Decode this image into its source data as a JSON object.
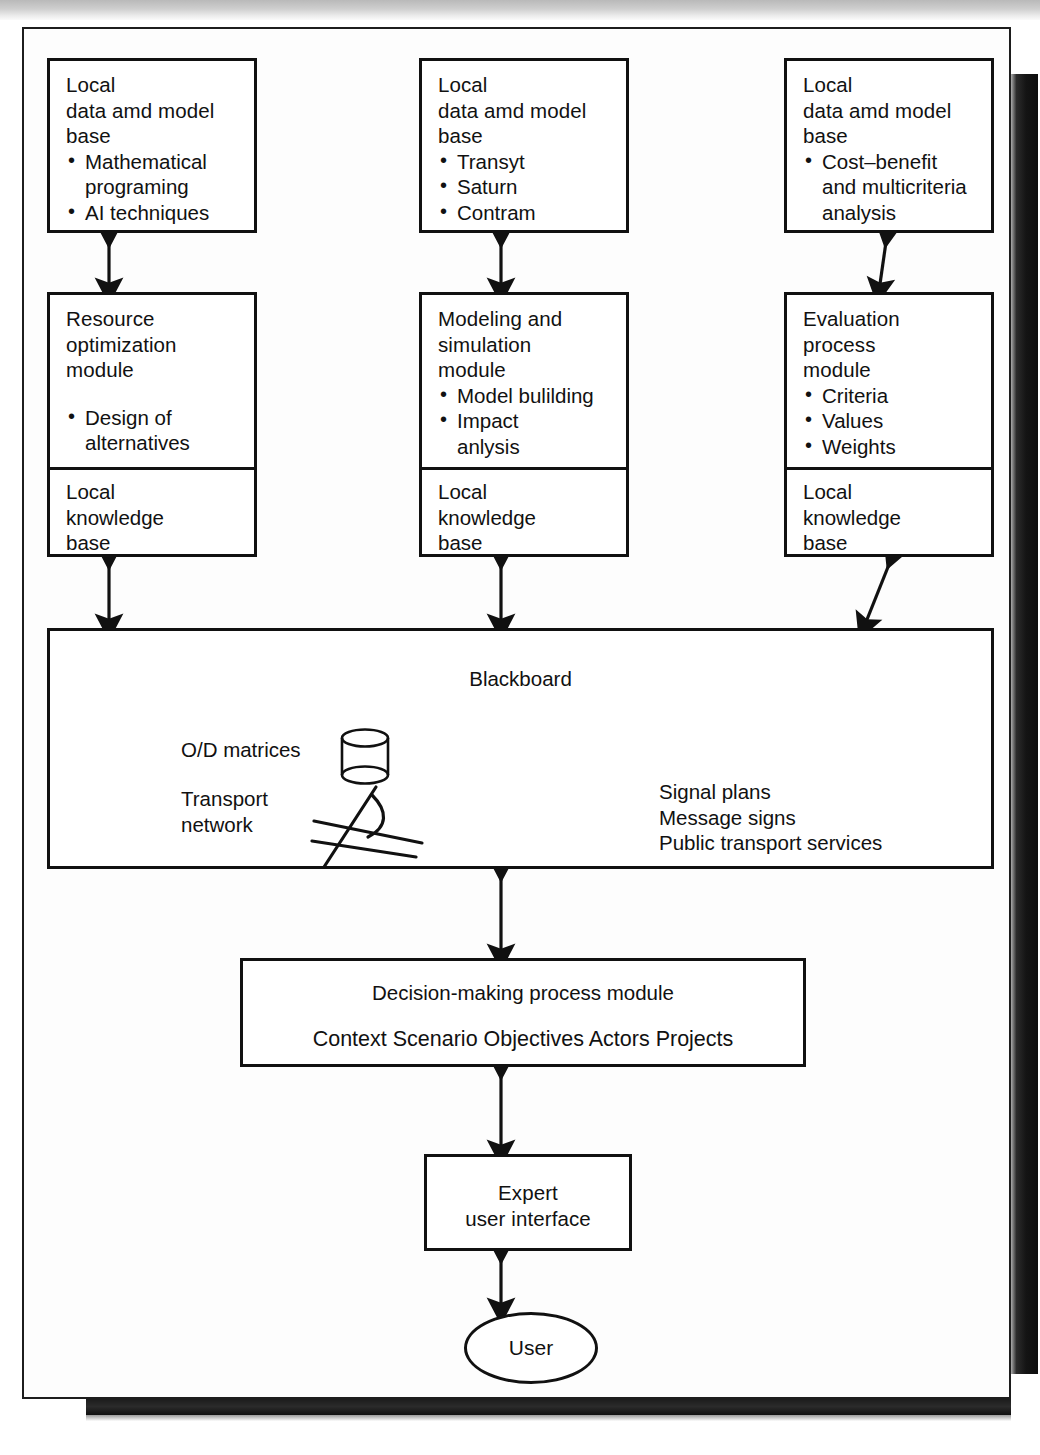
{
  "figure": {
    "ink_color": "#111111",
    "paper_color": "#fdfdfd"
  },
  "columns": [
    {
      "data_base": {
        "title": "Local\ndata amd model\nbase",
        "bullets": [
          "Mathematical\nprograming",
          "AI techniques"
        ]
      },
      "module": {
        "title": "Resource\noptimization\nmodule",
        "bullets": [
          "Design of\nalternatives"
        ],
        "knowledge_base": "Local\nknowledge\nbase"
      }
    },
    {
      "data_base": {
        "title": "Local\ndata amd model\nbase",
        "bullets": [
          "Transyt",
          "Saturn",
          "Contram"
        ]
      },
      "module": {
        "title": "Modeling and\nsimulation\nmodule",
        "bullets": [
          "Model bulilding",
          "Impact\nanlysis"
        ],
        "knowledge_base": "Local\nknowledge\nbase"
      }
    },
    {
      "data_base": {
        "title": "Local\ndata amd model\nbase",
        "bullets": [
          "Cost–benefit\nand multicriteria\nanalysis"
        ]
      },
      "module": {
        "title": "Evaluation\nprocess\nmodule",
        "bullets": [
          "Criteria",
          "Values",
          "Weights"
        ],
        "knowledge_base": "Local\nknowledge\nbase"
      }
    }
  ],
  "blackboard": {
    "label": "Blackboard",
    "left_items": "O/D matrices",
    "left_items_2": "Transport\nnetwork",
    "right_items": "Signal plans\nMessage signs\nPublic transport services",
    "icons": [
      "database-cylinder-icon",
      "road-network-icon"
    ]
  },
  "decision_module": {
    "title": "Decision-making process module",
    "items": "Context  Scenario  Objectives  Actors  Projects"
  },
  "interface": {
    "title": "Expert\nuser interface"
  },
  "user": {
    "label": "User"
  }
}
